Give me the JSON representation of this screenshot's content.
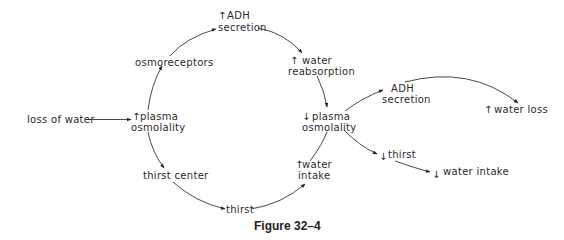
{
  "figure": {
    "caption": "Figure 32–4",
    "nodes": {
      "loss_of_water": "loss of water",
      "plasma_osm_up": {
        "arrow": "↑",
        "line1": "plasma",
        "line2": "osmolality"
      },
      "osmoreceptors": "osmoreceptors",
      "adh_up": {
        "arrow": "↑",
        "line1": "ADH",
        "line2": "secretion"
      },
      "water_reabs_up": {
        "arrow": "↑",
        "line1": "water",
        "line2": "reabsorption"
      },
      "plasma_osm_down": {
        "arrow": "↓",
        "line1": "plasma",
        "line2": "osmolality"
      },
      "adh_down": {
        "line1": "ADH",
        "line2": "secretion"
      },
      "water_loss_up": {
        "arrow": "↑",
        "label": "water loss"
      },
      "thirst_down": {
        "arrow": "↓",
        "label": "thirst"
      },
      "water_intake_down": {
        "arrow": "↓",
        "label": "water intake"
      },
      "water_intake_up": {
        "arrow": "↑",
        "line1": "water",
        "line2": "intake"
      },
      "thirst_center": "thirst center",
      "thirst": "thirst"
    }
  }
}
